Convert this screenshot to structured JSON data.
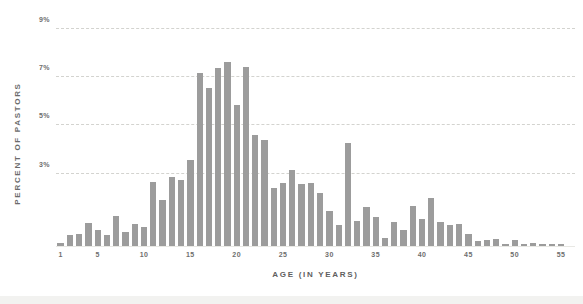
{
  "chart_data": {
    "type": "bar",
    "title": "",
    "subtitle": "",
    "xlabel": "AGE (IN YEARS)",
    "ylabel": "PERCENT OF PASTORS",
    "ylim": [
      0,
      9.6
    ],
    "xlim": [
      0.5,
      56.5
    ],
    "grid": true,
    "grid_axis": "y",
    "legend": false,
    "legend_position": "none",
    "ytick_labels": [
      "9%",
      "7%",
      "5%",
      "3%"
    ],
    "yticks": [
      9,
      7,
      5,
      3
    ],
    "xtick_labels": [
      "1",
      "5",
      "10",
      "15",
      "20",
      "25",
      "30",
      "35",
      "40",
      "45",
      "50",
      "55"
    ],
    "xticks": [
      1,
      5,
      10,
      15,
      20,
      25,
      30,
      35,
      40,
      45,
      50,
      55
    ],
    "bar_color": "#9c9c9c",
    "gridline_color": "#d3d3cf",
    "axis_text_color": "#6e6e6e",
    "categories": [
      1,
      2,
      3,
      4,
      5,
      6,
      7,
      8,
      9,
      10,
      11,
      12,
      13,
      14,
      15,
      16,
      17,
      18,
      19,
      20,
      21,
      22,
      23,
      24,
      25,
      26,
      27,
      28,
      29,
      30,
      31,
      32,
      33,
      34,
      35,
      36,
      37,
      38,
      39,
      40,
      41,
      42,
      43,
      44,
      45,
      46,
      47,
      48,
      49,
      50,
      51,
      52,
      53,
      54,
      55
    ],
    "values": [
      0.12,
      0.45,
      0.5,
      0.95,
      0.65,
      0.45,
      1.25,
      0.6,
      0.9,
      0.8,
      2.65,
      1.9,
      2.85,
      2.75,
      3.55,
      7.15,
      6.55,
      7.35,
      7.6,
      5.85,
      7.4,
      4.6,
      4.4,
      2.4,
      2.6,
      3.15,
      2.55,
      2.6,
      2.2,
      1.45,
      0.85,
      4.25,
      1.05,
      1.6,
      1.2,
      0.35,
      1.0,
      0.65,
      1.65,
      1.1,
      2.0,
      1.0,
      0.85,
      0.9,
      0.5,
      0.2,
      0.25,
      0.3,
      0.1,
      0.25,
      0.08,
      0.12,
      0.1,
      0.1,
      0.1
    ]
  },
  "axis": {
    "ylabel": "PERCENT OF PASTORS",
    "xlabel": "AGE (IN YEARS)"
  }
}
